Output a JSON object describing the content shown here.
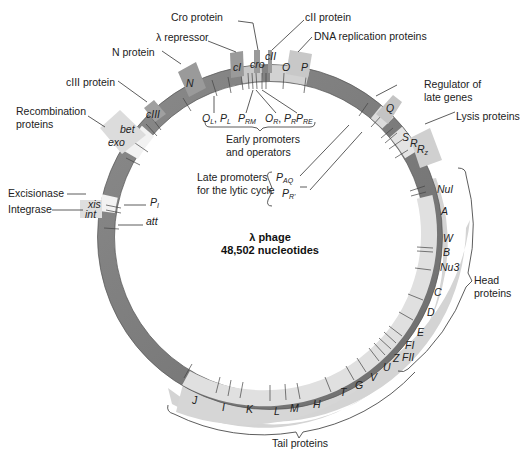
{
  "center": {
    "title": "λ phage",
    "subtitle": "48,502 nucleotides"
  },
  "colors": {
    "ring_dark": "#7a7a7a",
    "ring_light": "#e2e2e2",
    "ring_white": "#f4f4f4",
    "tab_gray": "#9a9a9a",
    "tab_light": "#cfcfcf",
    "band_light": "#d6d6d6",
    "text": "#222222"
  },
  "top_labels": {
    "cro_protein": "Cro protein",
    "lambda_repressor": "λ repressor",
    "cII_protein": "cII protein",
    "dna_replication": "DNA replication proteins",
    "n_protein": "N protein",
    "cIII_protein": "cIII protein",
    "recombination_1": "Recombination",
    "recombination_2": "proteins",
    "regulator_1": "Regulator of",
    "regulator_2": "late genes",
    "lysis": "Lysis proteins",
    "excisionase": "Excisionase",
    "integrase": "Integrase"
  },
  "genes": {
    "cI": "cI",
    "cro": "cro",
    "cII": "cII",
    "O": "O",
    "P": "P",
    "N": "N",
    "cIII": "cIII",
    "bet": "bet",
    "exo": "exo",
    "xis": "xis",
    "int": "int",
    "att": "att",
    "PI": "P",
    "PI_sub": "I",
    "Q": "Q",
    "S": "S",
    "R": "R",
    "Rz": "R",
    "Rz_sub": "z",
    "Nul": "Nul",
    "A": "A",
    "W": "W",
    "B": "B",
    "Nu3": "Nu3",
    "C": "C",
    "D": "D",
    "E": "E",
    "FI": "FI",
    "FII": "FII",
    "Z": "Z",
    "U": "U",
    "V": "V",
    "G": "G",
    "T": "T",
    "H": "H",
    "M": "M",
    "L": "L",
    "K": "K",
    "I": "I",
    "J": "J"
  },
  "promoters": {
    "OL": "O",
    "OL_sub": "L",
    "PL": "P",
    "PL_sub": "L",
    "PRM": "P",
    "PRM_sub": "RM",
    "OR": "O",
    "OR_sub": "R",
    "PR": "P",
    "PR_sub": "R",
    "PRE": "P",
    "PRE_sub": "RE",
    "PAQ": "P",
    "PAQ_sub": "AQ",
    "PR2": "P",
    "PR2_sub": "R'"
  },
  "groups": {
    "early_1": "Early promoters",
    "early_2": "and operators",
    "late_1": "Late promoters",
    "late_2": "for the lytic cycle",
    "head_1": "Head",
    "head_2": "proteins",
    "tail": "Tail proteins"
  }
}
